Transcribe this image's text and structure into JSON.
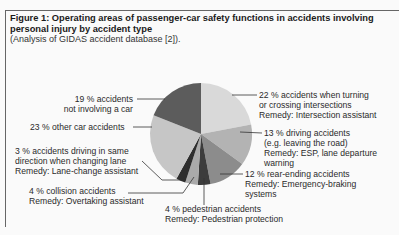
{
  "figure": {
    "title": "Figure 1: Operating areas of passenger-car safety functions in accidents involving personal injury by accident type",
    "subtitle": "(Analysis of GIDAS accident database [2])."
  },
  "chart_data": {
    "type": "pie",
    "title": "Operating areas of passenger-car safety functions in accidents involving personal injury by accident type",
    "subtitle": "Analysis of GIDAS accident database [2]",
    "start_angle": "12 o'clock, clockwise",
    "slices": [
      {
        "label": "accidents when turning or crossing intersections",
        "value": 22,
        "remedy": "Intersection assistant",
        "color": "#d9d9d9"
      },
      {
        "label": "driving accidents (e.g. leaving the road)",
        "value": 13,
        "remedy": "ESP, lane departure warning",
        "color": "#b3b3b3"
      },
      {
        "label": "rear-ending accidents",
        "value": 12,
        "remedy": "Emergency-braking systems",
        "color": "#8c8c8c"
      },
      {
        "label": "pedestrian accidents",
        "value": 4,
        "remedy": "Pedestrian protection",
        "color": "#3c3c3c"
      },
      {
        "label": "collision accidents",
        "value": 4,
        "remedy": "Overtaking assistant",
        "color": "#aaaaaa"
      },
      {
        "label": "accidents driving in same direction when changing lane",
        "value": 3,
        "remedy": "Lane-change assistant",
        "color": "#2e2e2e"
      },
      {
        "label": "other car accidents",
        "value": 23,
        "remedy": "",
        "color": "#c6c6c6"
      },
      {
        "label": "accidents not involving a car",
        "value": 19,
        "remedy": "",
        "color": "#5c5c5c"
      }
    ]
  },
  "labels": {
    "intersection": {
      "l1": "22 % accidents when turning",
      "l2": "or crossing intersections",
      "l3": "Remedy: Intersection assistant"
    },
    "driving": {
      "l1": "13 % driving accidents",
      "l2": "(e.g. leaving the road)",
      "l3": "Remedy: ESP, lane departure",
      "l4": "warning"
    },
    "rear": {
      "l1": "12 % rear-ending accidents",
      "l2": "Remedy: Emergency-braking",
      "l3": "systems"
    },
    "pedestrian": {
      "l1": "4 % pedestrian accidents",
      "l2": "Remedy: Pedestrian protection"
    },
    "collision": {
      "l1": "4 % collision accidents",
      "l2": "Remedy: Overtaking assistant"
    },
    "lane": {
      "l1": "3 % accidents driving in same",
      "l2": "direction when changing lane",
      "l3": "Remedy: Lane-change assistant"
    },
    "other": {
      "l1": "23 % other car accidents"
    },
    "notcar": {
      "l1": "19 % accidents",
      "l2": "not involving a car"
    }
  }
}
